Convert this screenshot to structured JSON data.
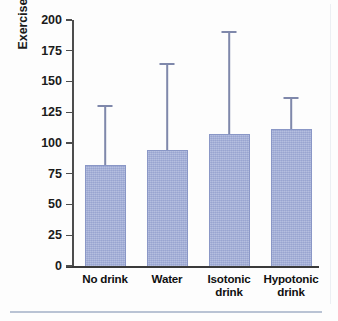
{
  "chart_data": {
    "type": "bar",
    "title": "",
    "xlabel": "",
    "ylabel": "Exercise time (min)",
    "categories": [
      "No drink",
      "Water",
      "Isotonic drink",
      "Hypotonic drink"
    ],
    "values": [
      82,
      94,
      107,
      111
    ],
    "error_upper": [
      131,
      165,
      191,
      137
    ],
    "ylim": [
      0,
      200
    ],
    "yticks": [
      0,
      25,
      50,
      75,
      100,
      125,
      150,
      175,
      200
    ],
    "ytick_labels": [
      "0",
      "25",
      "50",
      "75",
      "100",
      "125",
      "150",
      "175",
      "200"
    ],
    "grid": false,
    "legend": null,
    "bar_color": "#9fabd6",
    "error_bar_color": "#7f88ab",
    "axis_color": "#3a3a3a",
    "error_bar_style": "upper-only-with-cap"
  },
  "axis": {
    "y_title": "Exercise time (min)"
  },
  "category_labels": [
    "No drink",
    "Water",
    "Isotonic\ndrink",
    "Hypotonic\ndrink"
  ]
}
